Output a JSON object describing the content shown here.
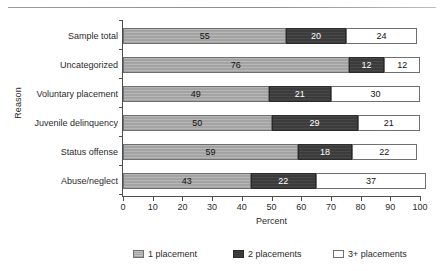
{
  "chart_data": {
    "type": "bar",
    "subtype": "stacked-horizontal-100pct",
    "title": "",
    "xlabel": "Percent",
    "ylabel": "Reason",
    "xlim": [
      0,
      100
    ],
    "xticks": [
      0,
      10,
      20,
      30,
      40,
      50,
      60,
      70,
      80,
      90,
      100
    ],
    "xtick_labels": [
      "0",
      "10",
      "20",
      "30",
      "40",
      "50",
      "60",
      "70",
      "80",
      "90",
      "100"
    ],
    "grid": false,
    "legend_position": "bottom",
    "categories": [
      "Sample total",
      "Uncategorized",
      "Voluntary placement",
      "Juvenile delinquency",
      "Status offense",
      "Abuse/neglect"
    ],
    "series": [
      {
        "name": "1 placement",
        "color": "#a3a3a3",
        "values": [
          55,
          76,
          49,
          50,
          59,
          43
        ]
      },
      {
        "name": "2 placements",
        "color": "#3b3b3b",
        "values": [
          20,
          12,
          21,
          29,
          18,
          22
        ]
      },
      {
        "name": "3+ placements",
        "color": "#ffffff",
        "values": [
          24,
          12,
          30,
          21,
          22,
          37
        ]
      }
    ],
    "bar_labels": [
      [
        "55",
        "20",
        "24"
      ],
      [
        "76",
        "12",
        "12"
      ],
      [
        "49",
        "21",
        "30"
      ],
      [
        "50",
        "29",
        "21"
      ],
      [
        "59",
        "18",
        "22"
      ],
      [
        "43",
        "22",
        "37"
      ]
    ]
  },
  "legend": {
    "items": [
      {
        "label": "1 placement",
        "swatch": "legend-swatch-1-placement"
      },
      {
        "label": "2 placements",
        "swatch": "legend-swatch-2-placements"
      },
      {
        "label": "3+ placements",
        "swatch": "legend-swatch-3plus-placements"
      }
    ]
  }
}
